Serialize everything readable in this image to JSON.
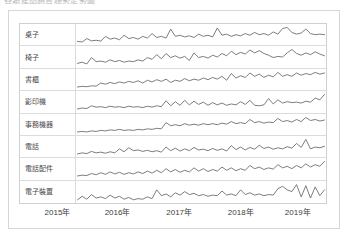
{
  "page": {
    "title_clipped": "各類產品銷售趨勢走勢圖"
  },
  "table": {
    "label_column_header": "",
    "rows": [
      {
        "label": "桌子"
      },
      {
        "label": "椅子"
      },
      {
        "label": "書櫃"
      },
      {
        "label": "影印機"
      },
      {
        "label": "事務機器"
      },
      {
        "label": "電話"
      },
      {
        "label": "電話配件"
      },
      {
        "label": "電子裝置"
      }
    ]
  },
  "axis": {
    "ticks": [
      {
        "label": "2015年",
        "pos_pct": 12.5
      },
      {
        "label": "2016年",
        "pos_pct": 32.0
      },
      {
        "label": "2017年",
        "pos_pct": 52.0
      },
      {
        "label": "2018年",
        "pos_pct": 72.0
      },
      {
        "label": "2019年",
        "pos_pct": 90.5
      }
    ]
  },
  "colors": {
    "sparkline_stroke": "#6e6e6e",
    "grid_line": "#dcdcdc",
    "outer_border": "#d6d6d6",
    "label_text": "#4a4a4a",
    "axis_text": "#3c3c3c"
  },
  "chart_data": {
    "type": "line",
    "title": "各類產品銷售趨勢走勢圖",
    "xlabel": "",
    "ylabel": "",
    "grid": false,
    "legend": "none",
    "x": [
      "2015-01",
      "2015-02",
      "2015-03",
      "2015-04",
      "2015-05",
      "2015-06",
      "2015-07",
      "2015-08",
      "2015-09",
      "2015-10",
      "2015-11",
      "2015-12",
      "2016-01",
      "2016-02",
      "2016-03",
      "2016-04",
      "2016-05",
      "2016-06",
      "2016-07",
      "2016-08",
      "2016-09",
      "2016-10",
      "2016-11",
      "2016-12",
      "2017-01",
      "2017-02",
      "2017-03",
      "2017-04",
      "2017-05",
      "2017-06",
      "2017-07",
      "2017-08",
      "2017-09",
      "2017-10",
      "2017-11",
      "2017-12",
      "2018-01",
      "2018-02",
      "2018-03",
      "2018-04",
      "2018-05",
      "2018-06",
      "2018-07",
      "2018-08",
      "2018-09",
      "2018-10",
      "2018-11",
      "2018-12",
      "2019-01",
      "2019-02",
      "2019-03",
      "2019-04",
      "2019-05",
      "2019-06"
    ],
    "series": [
      {
        "name": "桌子",
        "values": [
          12,
          10,
          22,
          14,
          16,
          13,
          30,
          20,
          24,
          18,
          34,
          22,
          26,
          20,
          30,
          24,
          40,
          26,
          30,
          24,
          56,
          30,
          34,
          28,
          32,
          26,
          38,
          30,
          34,
          28,
          60,
          34,
          38,
          30,
          36,
          32,
          40,
          34,
          44,
          36,
          40,
          34,
          46,
          38,
          58,
          62,
          44,
          38,
          42,
          56,
          40,
          36,
          38,
          36
        ]
      },
      {
        "name": "椅子",
        "values": [
          10,
          14,
          8,
          30,
          16,
          18,
          14,
          22,
          16,
          20,
          14,
          18,
          16,
          22,
          18,
          30,
          24,
          40,
          26,
          44,
          30,
          36,
          28,
          34,
          20,
          46,
          30,
          34,
          28,
          38,
          32,
          44,
          36,
          52,
          40,
          48,
          42,
          56,
          46,
          54,
          44,
          38,
          30,
          34,
          32,
          46,
          58,
          44,
          38,
          46,
          40,
          50,
          42,
          36
        ]
      },
      {
        "name": "書櫃",
        "values": [
          6,
          8,
          7,
          10,
          9,
          20,
          16,
          22,
          18,
          24,
          20,
          26,
          22,
          28,
          20,
          30,
          24,
          32,
          26,
          34,
          22,
          30,
          26,
          36,
          28,
          34,
          30,
          38,
          32,
          40,
          34,
          44,
          30,
          54,
          38,
          46,
          40,
          56,
          44,
          52,
          40,
          48,
          42,
          58,
          44,
          50,
          44,
          56,
          48,
          54,
          50,
          58,
          52,
          56
        ]
      },
      {
        "name": "影印機",
        "values": [
          8,
          12,
          10,
          22,
          16,
          18,
          14,
          20,
          16,
          18,
          14,
          20,
          16,
          18,
          14,
          20,
          16,
          22,
          18,
          44,
          22,
          40,
          24,
          46,
          26,
          42,
          28,
          38,
          24,
          36,
          26,
          34,
          24,
          30,
          26,
          40,
          28,
          46,
          24,
          22,
          26,
          54,
          30,
          48,
          34,
          40,
          36,
          38,
          34,
          42,
          38,
          56,
          48,
          72
        ]
      },
      {
        "name": "事務機器",
        "values": [
          10,
          11,
          10,
          12,
          11,
          13,
          12,
          14,
          13,
          15,
          13,
          14,
          13,
          15,
          14,
          16,
          15,
          17,
          16,
          28,
          22,
          24,
          22,
          26,
          23,
          25,
          23,
          26,
          24,
          26,
          24,
          27,
          25,
          30,
          26,
          28,
          26,
          34,
          28,
          30,
          27,
          29,
          28,
          36,
          30,
          32,
          29,
          34,
          30,
          38,
          32,
          34,
          31,
          33
        ]
      },
      {
        "name": "電話",
        "values": [
          8,
          14,
          10,
          22,
          14,
          18,
          12,
          20,
          14,
          36,
          20,
          42,
          26,
          30,
          22,
          28,
          20,
          26,
          18,
          46,
          26,
          40,
          24,
          36,
          26,
          44,
          30,
          34,
          26,
          38,
          28,
          36,
          24,
          54,
          32,
          46,
          30,
          44,
          34,
          56,
          38,
          46,
          34,
          42,
          36,
          48,
          40,
          66,
          44,
          88,
          36,
          46,
          42,
          50
        ]
      },
      {
        "name": "電話配件",
        "values": [
          8,
          10,
          9,
          14,
          11,
          16,
          12,
          18,
          13,
          17,
          12,
          16,
          13,
          18,
          14,
          20,
          15,
          22,
          16,
          26,
          18,
          24,
          17,
          22,
          18,
          28,
          20,
          26,
          19,
          24,
          20,
          30,
          22,
          28,
          21,
          26,
          22,
          34,
          26,
          30,
          24,
          28,
          25,
          36,
          28,
          32,
          26,
          34,
          28,
          38,
          30,
          36,
          32,
          44
        ]
      },
      {
        "name": "電子裝置",
        "values": [
          10,
          22,
          12,
          28,
          16,
          20,
          14,
          26,
          16,
          22,
          12,
          18,
          10,
          14,
          12,
          20,
          14,
          44,
          24,
          30,
          20,
          34,
          26,
          38,
          28,
          32,
          24,
          28,
          22,
          26,
          24,
          40,
          26,
          30,
          24,
          44,
          28,
          34,
          26,
          30,
          24,
          28,
          26,
          48,
          56,
          44,
          38,
          62,
          20,
          58,
          16,
          54,
          24,
          44
        ]
      }
    ]
  }
}
